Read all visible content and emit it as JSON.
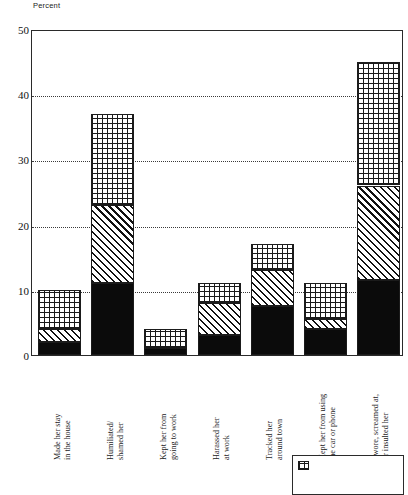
{
  "chart_data": {
    "type": "bar",
    "subtype": "stacked",
    "title": "",
    "ylabel": "Percent",
    "xlabel": "",
    "ylim": [
      0,
      50
    ],
    "yticks": [
      0,
      10,
      20,
      30,
      40,
      50
    ],
    "grid": true,
    "gridlines_at": [
      10,
      20,
      30,
      40
    ],
    "legend_position": "bottom-right",
    "categories": [
      "Made her stay\nin the house",
      "Humiliated/\nshamed her",
      "Kept her from\ngoing to work",
      "Harassed her\nat work",
      "Tracked her\naround town",
      "Kept her from using\nthe car or phone",
      "Swore, screamed at,\nor insulted her"
    ],
    "series": [
      {
        "name": "Often",
        "pattern": "solid-black",
        "values": [
          2.0,
          11.0,
          1.0,
          3.0,
          7.5,
          4.0,
          11.5
        ]
      },
      {
        "name": "Sometimes",
        "pattern": "diagonal-hatch",
        "values": [
          2.0,
          12.0,
          0.0,
          5.0,
          5.5,
          1.5,
          14.5
        ]
      },
      {
        "name": "Rarely",
        "pattern": "cross-hatch",
        "values": [
          6.0,
          14.0,
          3.0,
          3.0,
          4.0,
          5.5,
          19.0
        ]
      }
    ],
    "totals": [
      10.0,
      37.0,
      4.0,
      11.0,
      17.0,
      11.0,
      45.0
    ]
  },
  "axis": {
    "y_title": "Percent",
    "tick_labels": [
      "0",
      "10",
      "20",
      "30",
      "40",
      "50"
    ]
  },
  "legend": {
    "items": [
      {
        "label": "",
        "pattern": "cross-hatch"
      }
    ]
  }
}
